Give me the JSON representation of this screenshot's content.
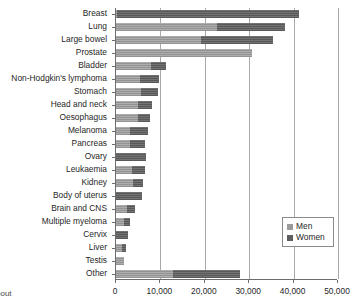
{
  "chart_data": {
    "type": "bar",
    "orientation": "horizontal",
    "stacked": true,
    "title": "",
    "subtitle": "",
    "xlabel": "",
    "ylabel": "",
    "xlim": [
      0,
      50000
    ],
    "xticks": [
      0,
      10000,
      20000,
      30000,
      40000,
      50000
    ],
    "xtick_labels": [
      "0",
      "10,000",
      "20,000",
      "30,000",
      "40,000",
      "50,000"
    ],
    "grid": "vertical",
    "legend_position": "bottom-right",
    "categories": [
      "Breast",
      "Lung",
      "Large bowel",
      "Prostate",
      "Bladder",
      "Non-Hodgkin's lymphoma",
      "Stomach",
      "Head and neck",
      "Oesophagus",
      "Melanoma",
      "Pancreas",
      "Ovary",
      "Leukaemia",
      "Kidney",
      "Body of uterus",
      "Brain and CNS",
      "Multiple myeloma",
      "Cervix",
      "Liver",
      "Testis",
      "Other"
    ],
    "series": [
      {
        "name": "Men",
        "color": "#9b9b9b",
        "values": [
          300,
          22700,
          19100,
          30600,
          7900,
          5400,
          5600,
          5000,
          5000,
          3100,
          3200,
          0,
          3700,
          3800,
          0,
          2400,
          1700,
          0,
          1400,
          1700,
          12800
        ]
      },
      {
        "name": "Women",
        "color": "#5e5e5e",
        "values": [
          40900,
          15300,
          16300,
          0,
          3350,
          4300,
          3900,
          3100,
          2600,
          4100,
          3400,
          6800,
          2900,
          2200,
          5800,
          1900,
          1500,
          2800,
          900,
          0,
          15200
        ]
      }
    ],
    "totals": [
      41200,
      38000,
      35400,
      30600,
      11250,
      9700,
      9500,
      8100,
      7600,
      7200,
      6600,
      6800,
      6600,
      6000,
      5800,
      4300,
      3200,
      2800,
      2300,
      1700,
      28000
    ]
  },
  "legend": {
    "items": [
      {
        "label": "Men",
        "color": "#9b9b9b"
      },
      {
        "label": "Women",
        "color": "#5e5e5e"
      }
    ]
  },
  "footer": {
    "corner_text": "bout"
  }
}
